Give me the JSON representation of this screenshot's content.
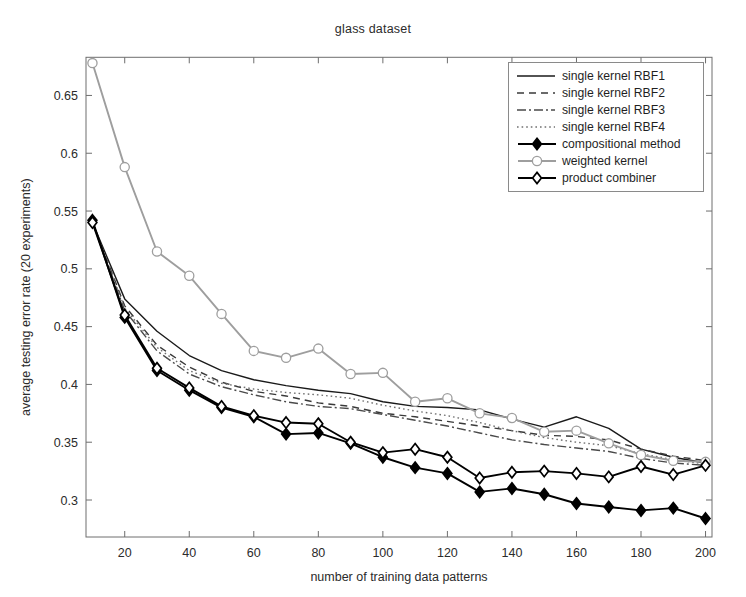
{
  "chart_data": {
    "type": "line",
    "title": "glass dataset",
    "xlabel": "number of training data patterns",
    "ylabel": "average testing error rate (20 experiments)",
    "xlim": [
      8,
      202
    ],
    "ylim": [
      0.268,
      0.683
    ],
    "xticks": [
      20,
      40,
      60,
      80,
      100,
      120,
      140,
      160,
      180,
      200
    ],
    "yticks": [
      0.3,
      0.35,
      0.4,
      0.45,
      0.5,
      0.55,
      0.6,
      0.65
    ],
    "grid": false,
    "legend_position": "top-right-inside",
    "x": [
      10,
      20,
      30,
      40,
      50,
      60,
      70,
      80,
      90,
      100,
      110,
      120,
      130,
      140,
      150,
      160,
      170,
      180,
      190,
      200
    ],
    "series": [
      {
        "name": "single kernel RBF1",
        "style": "solid",
        "marker": "none",
        "color": "#1a1a1a",
        "values": [
          0.54,
          0.474,
          0.446,
          0.425,
          0.412,
          0.404,
          0.399,
          0.395,
          0.392,
          0.385,
          0.381,
          0.38,
          0.378,
          0.37,
          0.363,
          0.372,
          0.362,
          0.344,
          0.337,
          0.332
        ]
      },
      {
        "name": "single kernel RBF2",
        "style": "dashed",
        "marker": "none",
        "color": "#3a3a3a",
        "values": [
          0.54,
          0.468,
          0.434,
          0.415,
          0.402,
          0.394,
          0.39,
          0.384,
          0.381,
          0.375,
          0.372,
          0.368,
          0.364,
          0.36,
          0.356,
          0.355,
          0.352,
          0.344,
          0.338,
          0.334
        ]
      },
      {
        "name": "single kernel RBF3",
        "style": "dashdot",
        "marker": "none",
        "color": "#4a4a4a",
        "values": [
          0.54,
          0.464,
          0.429,
          0.409,
          0.398,
          0.391,
          0.385,
          0.381,
          0.379,
          0.374,
          0.369,
          0.364,
          0.358,
          0.352,
          0.348,
          0.345,
          0.342,
          0.336,
          0.332,
          0.33
        ]
      },
      {
        "name": "single kernel RBF4",
        "style": "dotted",
        "marker": "none",
        "color": "#707070",
        "values": [
          0.54,
          0.466,
          0.432,
          0.412,
          0.401,
          0.396,
          0.393,
          0.391,
          0.388,
          0.382,
          0.377,
          0.373,
          0.367,
          0.36,
          0.354,
          0.35,
          0.347,
          0.34,
          0.335,
          0.331
        ]
      },
      {
        "name": "compositional method",
        "style": "solid",
        "marker": "filled-diamond",
        "color": "#000000",
        "values": [
          0.542,
          0.458,
          0.412,
          0.395,
          0.38,
          0.372,
          0.357,
          0.358,
          0.349,
          0.337,
          0.328,
          0.323,
          0.307,
          0.31,
          0.305,
          0.297,
          0.294,
          0.291,
          0.293,
          0.284
        ]
      },
      {
        "name": "weighted kernel",
        "style": "solid",
        "marker": "open-circle",
        "color": "#9e9e9e",
        "values": [
          0.678,
          0.588,
          0.515,
          0.494,
          0.461,
          0.429,
          0.423,
          0.431,
          0.409,
          0.41,
          0.385,
          0.388,
          0.375,
          0.371,
          0.359,
          0.36,
          0.349,
          0.339,
          0.334,
          0.333
        ]
      },
      {
        "name": "product combiner",
        "style": "solid",
        "marker": "open-diamond",
        "color": "#000000",
        "values": [
          0.54,
          0.46,
          0.414,
          0.397,
          0.381,
          0.373,
          0.367,
          0.366,
          0.35,
          0.341,
          0.344,
          0.337,
          0.319,
          0.324,
          0.325,
          0.323,
          0.32,
          0.329,
          0.322,
          0.33
        ]
      }
    ]
  },
  "legend": {
    "entries": [
      {
        "label": "single kernel RBF1"
      },
      {
        "label": "single kernel RBF2"
      },
      {
        "label": "single kernel RBF3"
      },
      {
        "label": "single kernel RBF4"
      },
      {
        "label": "compositional method"
      },
      {
        "label": "weighted kernel"
      },
      {
        "label": "product combiner"
      }
    ]
  }
}
